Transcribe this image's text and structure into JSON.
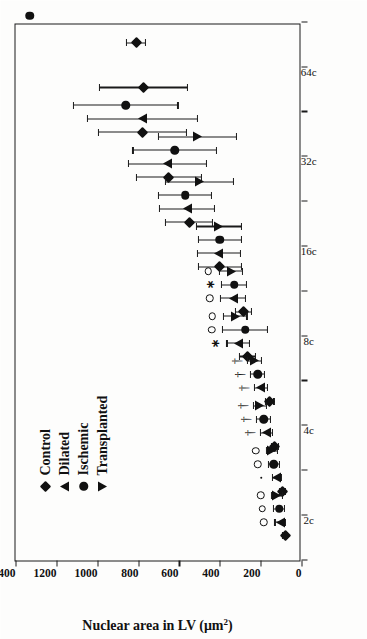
{
  "figure": {
    "y_axis_title_main": "Nuclear area in LV (μm",
    "y_axis_title_sup": "2",
    "y_axis_title_close": ")"
  },
  "legend": {
    "items": [
      {
        "label": "Control",
        "marker": "diamond-marker"
      },
      {
        "label": "Dilated",
        "marker": "triangle-up-marker"
      },
      {
        "label": "Ischemic",
        "marker": "circle-marker"
      },
      {
        "label": "Transplanted",
        "marker": "triangle-down-marker"
      }
    ]
  },
  "chart_data": {
    "type": "scatter",
    "title": "",
    "xlabel": "",
    "ylabel": "Nuclear area in LV (μm2)",
    "ylim": [
      0,
      1400
    ],
    "yticks": [
      0,
      200,
      400,
      600,
      800,
      1000,
      1200,
      1400
    ],
    "ytick_labels": [
      "0",
      "200",
      "400",
      "600",
      "800",
      "1000",
      "1200",
      "1400"
    ],
    "grid": false,
    "legend_position": "upper-left",
    "orientation": "rotated-90-ccw",
    "x_categories": [
      "2c",
      "4c",
      "8c",
      "16c",
      "32c",
      "64c"
    ],
    "x_tick_count": 13,
    "x_tick_labels": [
      "",
      "2c",
      "",
      "4c",
      "",
      "8c",
      "",
      "16c",
      "",
      "32c",
      "",
      "64c",
      ""
    ],
    "x_label_tick_indices": [
      1,
      3,
      5,
      7,
      9,
      11
    ],
    "series": [
      {
        "name": "Control",
        "marker": "diamond",
        "points": [
          {
            "group": "2c",
            "x": 0.55,
            "y": 80,
            "err_low": 12,
            "err_high": 12,
            "sig": null
          },
          {
            "group": "2c",
            "x": 1.55,
            "y": 95,
            "err_low": 14,
            "err_high": 14,
            "sig": null
          },
          {
            "group": "4c",
            "x": 2.55,
            "y": 130,
            "err_low": 18,
            "err_high": 18,
            "sig": null
          },
          {
            "group": "4c",
            "x": 3.55,
            "y": 155,
            "err_low": 20,
            "err_high": 20,
            "sig": null
          },
          {
            "group": "6c",
            "x": 4.55,
            "y": 265,
            "err_low": 38,
            "err_high": 38,
            "sig": null
          },
          {
            "group": "8c",
            "x": 5.55,
            "y": 285,
            "err_low": 40,
            "err_high": 40,
            "sig": null
          },
          {
            "group": "12c",
            "x": 6.55,
            "y": 400,
            "err_low": 105,
            "err_high": 105,
            "sig": null
          },
          {
            "group": "16c",
            "x": 7.55,
            "y": 550,
            "err_low": 115,
            "err_high": 115,
            "sig": null
          },
          {
            "group": "24c",
            "x": 8.55,
            "y": 650,
            "err_low": 160,
            "err_high": 160,
            "sig": null
          },
          {
            "group": "32c",
            "x": 9.55,
            "y": 780,
            "err_low": 215,
            "err_high": 215,
            "sig": null
          },
          {
            "group": "48c",
            "x": 10.55,
            "y": 775,
            "err_low": 215,
            "err_high": 215,
            "sig": null
          },
          {
            "group": "64c",
            "x": 11.55,
            "y": 810,
            "err_low": 45,
            "err_high": 45,
            "sig": null
          }
        ]
      },
      {
        "name": "Dilated",
        "marker": "triangle-up",
        "points": [
          {
            "group": "2c",
            "x": 0.85,
            "y": 105,
            "err_low": 25,
            "err_high": 25,
            "sig": "open-circle"
          },
          {
            "group": "2c",
            "x": 1.85,
            "y": 120,
            "err_low": 24,
            "err_high": 24,
            "sig": "dot"
          },
          {
            "group": "4c",
            "x": 2.85,
            "y": 170,
            "err_low": 30,
            "err_high": 30,
            "sig": "dagger"
          },
          {
            "group": "4c",
            "x": 3.85,
            "y": 200,
            "err_low": 32,
            "err_high": 32,
            "sig": "dagger"
          },
          {
            "group": "6c",
            "x": 4.85,
            "y": 310,
            "err_low": 55,
            "err_high": 55,
            "sig": "asterisk"
          },
          {
            "group": "8c",
            "x": 5.85,
            "y": 335,
            "err_low": 60,
            "err_high": 60,
            "sig": "open-circle"
          },
          {
            "group": "12c",
            "x": 6.85,
            "y": 405,
            "err_low": 105,
            "err_high": 105,
            "sig": null
          },
          {
            "group": "16c",
            "x": 7.85,
            "y": 560,
            "err_low": 135,
            "err_high": 135,
            "sig": null
          },
          {
            "group": "24c",
            "x": 8.85,
            "y": 655,
            "err_low": 190,
            "err_high": 190,
            "sig": null
          },
          {
            "group": "32c",
            "x": 9.85,
            "y": 780,
            "err_low": 270,
            "err_high": 270,
            "sig": null
          }
        ]
      },
      {
        "name": "Ischemic",
        "marker": "circle",
        "points": [
          {
            "group": "2c",
            "x": 1.15,
            "y": 110,
            "err_low": 28,
            "err_high": 28,
            "sig": "open-circle"
          },
          {
            "group": "2c",
            "x": 2.15,
            "y": 135,
            "err_low": 26,
            "err_high": 26,
            "sig": "open-circle"
          },
          {
            "group": "4c",
            "x": 3.15,
            "y": 185,
            "err_low": 34,
            "err_high": 34,
            "sig": "dagger"
          },
          {
            "group": "4c",
            "x": 4.15,
            "y": 215,
            "err_low": 34,
            "err_high": 34,
            "sig": "dagger"
          },
          {
            "group": "6c",
            "x": 5.15,
            "y": 275,
            "err_low": 110,
            "err_high": 110,
            "sig": "open-circle"
          },
          {
            "group": "8c",
            "x": 6.15,
            "y": 330,
            "err_low": 60,
            "err_high": 60,
            "sig": "asterisk"
          },
          {
            "group": "12c",
            "x": 7.15,
            "y": 400,
            "err_low": 105,
            "err_high": 105,
            "sig": null
          },
          {
            "group": "16c",
            "x": 8.15,
            "y": 570,
            "err_low": 130,
            "err_high": 130,
            "sig": null
          },
          {
            "group": "24c",
            "x": 9.15,
            "y": 620,
            "err_low": 205,
            "err_high": 205,
            "sig": null
          },
          {
            "group": "32c",
            "x": 10.15,
            "y": 860,
            "err_low": 255,
            "err_high": 255,
            "sig": null
          },
          {
            "group": "64c",
            "x": 12.15,
            "y": 1330,
            "err_low": 0,
            "err_high": 0,
            "sig": null
          }
        ]
      },
      {
        "name": "Transplanted",
        "marker": "triangle-down",
        "points": [
          {
            "group": "2c",
            "x": 1.45,
            "y": 120,
            "err_low": 26,
            "err_high": 26,
            "sig": "open-circle"
          },
          {
            "group": "2c",
            "x": 2.45,
            "y": 145,
            "err_low": 26,
            "err_high": 26,
            "sig": "open-circle"
          },
          {
            "group": "4c",
            "x": 3.45,
            "y": 205,
            "err_low": 32,
            "err_high": 32,
            "sig": "dagger"
          },
          {
            "group": "4c",
            "x": 4.45,
            "y": 230,
            "err_low": 34,
            "err_high": 34,
            "sig": "dagger"
          },
          {
            "group": "6c",
            "x": 5.45,
            "y": 325,
            "err_low": 58,
            "err_high": 58,
            "sig": "open-circle"
          },
          {
            "group": "8c",
            "x": 6.45,
            "y": 345,
            "err_low": 58,
            "err_high": 58,
            "sig": "open-circle"
          },
          {
            "group": "12c",
            "x": 7.45,
            "y": 405,
            "err_low": 110,
            "err_high": 110,
            "sig": null
          },
          {
            "group": "16c",
            "x": 8.45,
            "y": 500,
            "err_low": 165,
            "err_high": 165,
            "sig": null
          },
          {
            "group": "24c",
            "x": 9.45,
            "y": 510,
            "err_low": 190,
            "err_high": 190,
            "sig": null
          }
        ]
      }
    ]
  }
}
